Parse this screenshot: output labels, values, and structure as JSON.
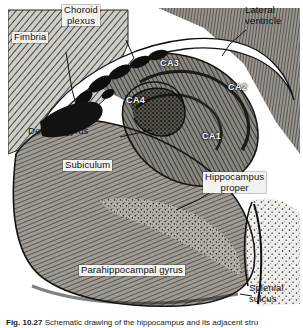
{
  "figure": {
    "caption_prefix": "Fig. 10.27",
    "caption_text": " Schematic drawing of the hippocampus and its adjacent stru",
    "alt": "Schematic engraving-style drawing of a coronal section through the hippocampal formation"
  },
  "labels": {
    "fimbria": "Fimbria",
    "choroid_plexus": "Choroid\nplexus",
    "lateral_ventricle": "Lateral\nventricle",
    "dentate_gyrus": "Dentate gyrus",
    "subiculum": "Subiculum",
    "hippocampus_proper": "Hippocampus\nproper",
    "parahippocampal_gyrus": "Parahippocampal gyrus",
    "splenial_sulcus": "Splenial\nsulcus"
  },
  "regions": {
    "ca1": "CA1",
    "ca2": "CA2",
    "ca3": "CA3",
    "ca4": "CA4"
  },
  "colors": {
    "ink": "#1a1a1a",
    "label_fill": "#f4f2ee",
    "ventricle": "#ffffff",
    "tissue_mid": "#8d8a84",
    "tissue_dark": "#3a3833",
    "page": "#ffffff"
  }
}
